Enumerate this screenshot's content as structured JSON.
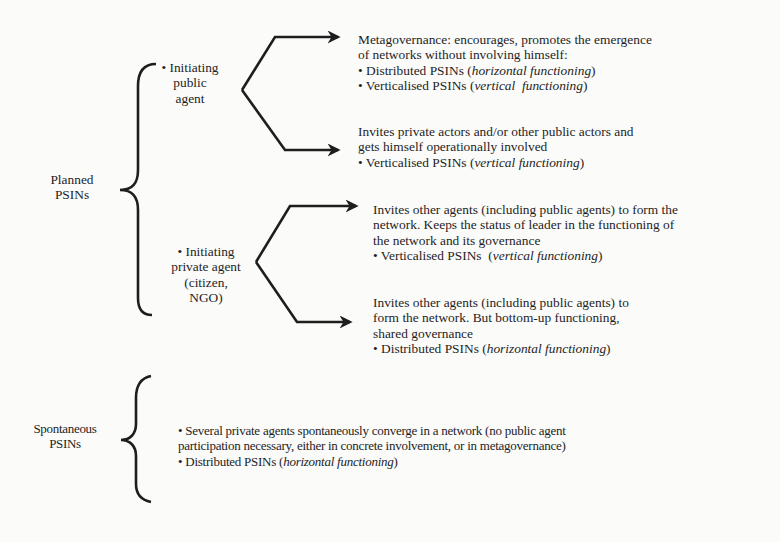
{
  "diagram": {
    "categories": [
      {
        "id": "planned",
        "label_lines": [
          "Planned",
          "PSINs"
        ],
        "initiators": [
          {
            "id": "public-agent",
            "label_lines": [
              "• Initiating",
              "public",
              "agent"
            ],
            "outcomes": [
              {
                "lines": [
                  "Metagovernance: encourages, promotes the emergence",
                  "of networks without involving himself:"
                ],
                "bullets": [
                  {
                    "prefix": "• Distributed PSINs (",
                    "italic": "horizontal functioning",
                    "suffix": ")"
                  },
                  {
                    "prefix": "• Verticalised PSINs (",
                    "italic": "vertical  functioning",
                    "suffix": ")"
                  }
                ]
              },
              {
                "lines": [
                  "Invites private actors and/or other public actors and",
                  "gets himself operationally involved"
                ],
                "bullets": [
                  {
                    "prefix": "• Verticalised PSINs (",
                    "italic": "vertical functioning",
                    "suffix": ")"
                  }
                ]
              }
            ]
          },
          {
            "id": "private-agent",
            "label_lines": [
              "• Initiating",
              "private agent",
              "(citizen,",
              "NGO)"
            ],
            "outcomes": [
              {
                "lines": [
                  "Invites other agents (including public agents) to form the",
                  "network. Keeps the status of leader in the functioning of",
                  "the network and its governance"
                ],
                "bullets": [
                  {
                    "prefix": "• Verticalised PSINs  (",
                    "italic": "vertical functioning",
                    "suffix": ")"
                  }
                ]
              },
              {
                "lines": [
                  "Invites other agents (including public agents) to",
                  "form the network. But bottom-up functioning,",
                  "shared governance"
                ],
                "bullets": [
                  {
                    "prefix": "• Distributed PSINs (",
                    "italic": "horizontal functioning",
                    "suffix": ")"
                  }
                ]
              }
            ]
          }
        ]
      },
      {
        "id": "spontaneous",
        "label_lines": [
          "Spontaneous",
          "PSINs"
        ],
        "description": {
          "lines": [
            "• Several private agents spontaneously converge in a network (no public agent",
            "participation necessary, either in concrete involvement, or in metagovernance)"
          ],
          "bullets": [
            {
              "prefix": "• Distributed PSINs (",
              "italic": "horizontal functioning",
              "suffix": ")"
            }
          ]
        }
      }
    ]
  },
  "colors": {
    "background": "#fbfbfa",
    "ink": "#1e1e1e"
  }
}
